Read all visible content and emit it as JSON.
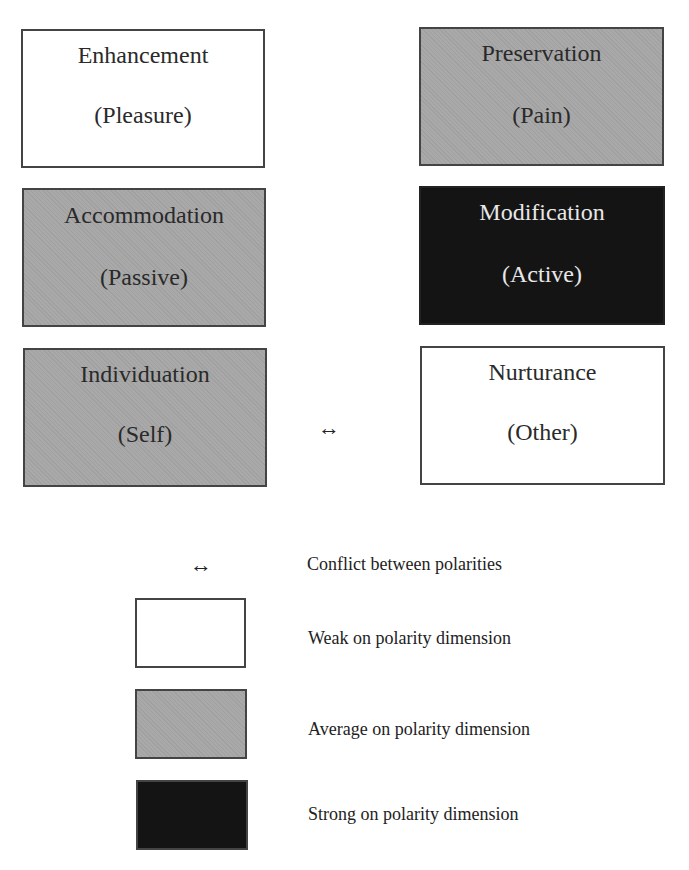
{
  "diagram": {
    "boxes": [
      {
        "title": "Enhancement",
        "subtitle": "(Pleasure)",
        "level": "weak"
      },
      {
        "title": "Preservation",
        "subtitle": "(Pain)",
        "level": "average"
      },
      {
        "title": "Accommodation",
        "subtitle": "(Passive)",
        "level": "average"
      },
      {
        "title": "Modification",
        "subtitle": "(Active)",
        "level": "strong"
      },
      {
        "title": "Individuation",
        "subtitle": "(Self)",
        "level": "average"
      },
      {
        "title": "Nurturance",
        "subtitle": "(Other)",
        "level": "weak"
      }
    ],
    "conflict_arrow": {
      "between": [
        "Individuation",
        "Nurturance"
      ],
      "glyph": "↔"
    }
  },
  "legend": {
    "items": [
      {
        "symbol": "↔",
        "label": "Conflict between polarities"
      },
      {
        "swatch": "weak",
        "color": "#ffffff",
        "label": "Weak on polarity dimension"
      },
      {
        "swatch": "average",
        "color": "#a9a9a9",
        "label": "Average on polarity dimension"
      },
      {
        "swatch": "strong",
        "color": "#141414",
        "label": "Strong on polarity dimension"
      }
    ]
  },
  "colors": {
    "weak": "#ffffff",
    "average": "#a9a9a9",
    "strong": "#141414",
    "border": "#444444"
  }
}
